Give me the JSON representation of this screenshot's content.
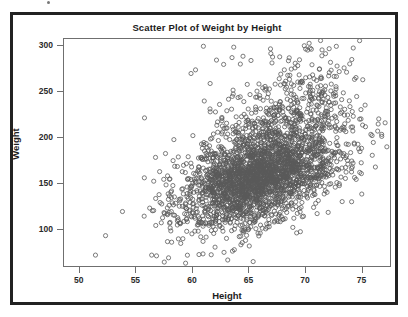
{
  "figure": {
    "title": "Scatter Plot of Weight by Height",
    "background_color": "#ffffff",
    "outer_border_color": "#222222",
    "plot_border_color": "#6f6f6f"
  },
  "axes": {
    "x": {
      "label": "Height",
      "ticks": [
        "50",
        "55",
        "60",
        "65",
        "70",
        "75"
      ],
      "min": 48.6,
      "max": 77.6
    },
    "y": {
      "label": "Weight",
      "ticks": [
        "100",
        "150",
        "200",
        "250",
        "300"
      ],
      "min": 58.0,
      "max": 308.0
    }
  },
  "marker": {
    "shape": "open-circle",
    "radius_px": 2.1,
    "stroke_color": "#5a5a5a",
    "stroke_width": 0.8,
    "fill": "none"
  },
  "chart_data": {
    "type": "scatter",
    "title": "Scatter Plot of Weight by Height",
    "xlabel": "Height",
    "ylabel": "Weight",
    "xlim": [
      48.6,
      77.6
    ],
    "ylim": [
      58.0,
      308.0
    ],
    "xticks": [
      50,
      55,
      60,
      65,
      70,
      75
    ],
    "yticks": [
      100,
      150,
      200,
      250,
      300
    ],
    "grid": false,
    "legend": null,
    "n_points": 3000,
    "marker_style": "open circle, gray outline, no fill",
    "relationship": "positive correlation between Height and Weight; dense central cloud with upper-tail outliers in Weight",
    "distribution": {
      "x_mean": 66.4,
      "x_sd": 3.6,
      "y_mean": 162.0,
      "y_sd": 30.5,
      "correlation": 0.5
    },
    "annotations": [],
    "outliers": [
      {
        "x": 51.4,
        "y": 70
      },
      {
        "x": 56.4,
        "y": 70
      },
      {
        "x": 57.9,
        "y": 67
      },
      {
        "x": 53.8,
        "y": 118
      },
      {
        "x": 61.0,
        "y": 300
      },
      {
        "x": 63.7,
        "y": 299
      },
      {
        "x": 67.0,
        "y": 292
      },
      {
        "x": 62.8,
        "y": 280
      },
      {
        "x": 60.3,
        "y": 274
      },
      {
        "x": 68.2,
        "y": 274
      },
      {
        "x": 72.2,
        "y": 271
      },
      {
        "x": 59.9,
        "y": 270
      },
      {
        "x": 61.6,
        "y": 259
      },
      {
        "x": 64.9,
        "y": 258
      },
      {
        "x": 68.4,
        "y": 255
      },
      {
        "x": 72.8,
        "y": 253
      },
      {
        "x": 76.6,
        "y": 220
      },
      {
        "x": 75.9,
        "y": 203
      },
      {
        "x": 76.3,
        "y": 167
      }
    ]
  }
}
